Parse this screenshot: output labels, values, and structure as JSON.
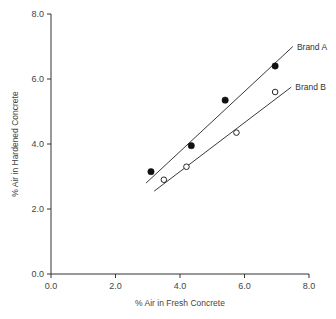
{
  "chart_data": {
    "type": "scatter",
    "title": "",
    "xlabel": "% Air in Fresh Concrete",
    "ylabel": "% Air in Hardened Concrete",
    "xlim": [
      0,
      8
    ],
    "ylim": [
      0,
      8
    ],
    "xticks": [
      "0.0",
      "2.0",
      "4.0",
      "6.0",
      "8.0"
    ],
    "yticks": [
      "0.0",
      "2.0",
      "4.0",
      "6.0",
      "8.0"
    ],
    "grid": false,
    "legend": "inline labels at end of fit lines",
    "series": [
      {
        "name": "Brand A",
        "marker": "filled-circle",
        "points": [
          {
            "x": 3.1,
            "y": 3.15
          },
          {
            "x": 4.35,
            "y": 3.95
          },
          {
            "x": 5.4,
            "y": 5.35
          },
          {
            "x": 6.95,
            "y": 6.4
          }
        ],
        "fit_line": {
          "x1": 2.95,
          "y1": 2.8,
          "x2": 7.5,
          "y2": 7.0
        }
      },
      {
        "name": "Brand B",
        "marker": "open-circle",
        "points": [
          {
            "x": 3.5,
            "y": 2.9
          },
          {
            "x": 4.2,
            "y": 3.3
          },
          {
            "x": 5.75,
            "y": 4.35
          },
          {
            "x": 6.95,
            "y": 5.6
          }
        ],
        "fit_line": {
          "x1": 3.2,
          "y1": 2.55,
          "x2": 7.45,
          "y2": 5.75
        }
      }
    ]
  }
}
